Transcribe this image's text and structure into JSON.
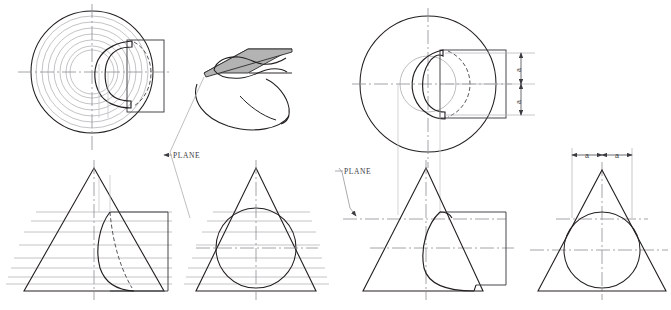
{
  "figure": {
    "type": "engineering-drawing",
    "background": "#ffffff",
    "colors": {
      "object_line": "#231f20",
      "construction_line": "#a9a9ad",
      "center_line": "#8e8e94",
      "hidden_line": "#4a4a4e",
      "plane_fill": "#b3b3b3",
      "plane_edge": "#2b2b2e",
      "text": "#3b3b41"
    },
    "labels": {
      "plane_top": "PLANE",
      "plane_front": "PLANE",
      "dim_a1": "a",
      "dim_a2": "a",
      "dim_a3": "a",
      "dim_a4": "a"
    }
  },
  "views": {
    "left_top": {
      "name": "top-view-left",
      "description": "Top view of cone showing concentric circles of cutting planes, kidney-shaped cut outline and right-side rectangle projection",
      "center": [
        92,
        72
      ],
      "outer_radius": 62,
      "concentric_radii": [
        62,
        56,
        50,
        44,
        38,
        32,
        26,
        22
      ],
      "rect": {
        "x": 127,
        "y": 40,
        "w": 37,
        "h": 72
      }
    },
    "pictorial": {
      "name": "pictorial-view",
      "description": "Isometric pictorial of cone cut by a shaded inclined plane",
      "plane_fill": "#b3b3b3"
    },
    "left_front": {
      "name": "front-view-left",
      "description": "Front view: triangle (cone) with horizontal cutting-plane lines, curve of intersection and right-side view rectangle",
      "apex": [
        94,
        168
      ],
      "base_left": [
        24,
        291
      ],
      "base_right": [
        164,
        291
      ],
      "cutting_line_count": 8
    },
    "left_side": {
      "name": "side-view-left",
      "description": "Side view: triangle with inscribed circle and horizontal cutting-plane lines",
      "apex": [
        256,
        168
      ],
      "base_left": [
        196,
        291
      ],
      "base_right": [
        316,
        291
      ],
      "circle_center": [
        256,
        248
      ],
      "circle_radius": 40
    },
    "right_top": {
      "name": "top-view-right",
      "description": "Top view of cone with two circles, kidney cut outline and rectangle, dimensioned a + a vertically",
      "center": [
        428,
        84
      ],
      "outer_radius": 68,
      "inner_radius": 28,
      "rect": {
        "x": 440,
        "y": 50,
        "w": 65,
        "h": 68
      }
    },
    "right_front": {
      "name": "front-view-right",
      "description": "Front view: triangle with cutting-plane centerlines, curve and right-side rectangle, PLANE leader arrow",
      "apex": [
        426,
        168
      ],
      "base_left": [
        363,
        291
      ],
      "base_right": [
        483,
        291
      ]
    },
    "right_side": {
      "name": "side-view-right",
      "description": "Side view: triangle with inscribed circle, dimensioned a and a across the top",
      "apex": [
        602,
        170
      ],
      "base_left": [
        538,
        291
      ],
      "base_right": [
        666,
        291
      ],
      "circle_center": [
        602,
        250
      ],
      "circle_radius": 38
    }
  }
}
